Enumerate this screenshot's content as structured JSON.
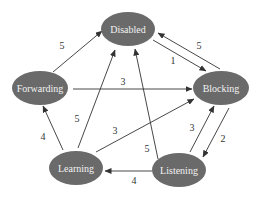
{
  "diagram": {
    "type": "state-transition-graph",
    "nodes": [
      {
        "id": "disabled",
        "label": "Disabled",
        "cx": 128,
        "cy": 29,
        "rx": 27,
        "ry": 17
      },
      {
        "id": "forwarding",
        "label": "Forwarding",
        "cx": 40,
        "cy": 88,
        "rx": 28,
        "ry": 17
      },
      {
        "id": "blocking",
        "label": "Blocking",
        "cx": 221,
        "cy": 88,
        "rx": 28,
        "ry": 17
      },
      {
        "id": "learning",
        "label": "Learning",
        "cx": 76,
        "cy": 168,
        "rx": 27,
        "ry": 17
      },
      {
        "id": "listening",
        "label": "Listening",
        "cx": 179,
        "cy": 170,
        "rx": 27,
        "ry": 17
      }
    ],
    "edges": [
      {
        "from": "forwarding",
        "to": "disabled",
        "label": "5",
        "x1": 53,
        "y1": 72,
        "x2": 102,
        "y2": 31,
        "lx": 62,
        "ly": 45
      },
      {
        "from": "disabled",
        "to": "blocking",
        "label": "1",
        "x1": 153,
        "y1": 40,
        "x2": 206,
        "y2": 71,
        "lx": 173,
        "ly": 60
      },
      {
        "from": "blocking",
        "to": "disabled",
        "label": "5",
        "x1": 220,
        "y1": 69,
        "x2": 158,
        "y2": 33,
        "lx": 199,
        "ly": 45
      },
      {
        "from": "forwarding",
        "to": "blocking",
        "label": "3",
        "x1": 73,
        "y1": 89,
        "x2": 192,
        "y2": 89,
        "lx": 123,
        "ly": 81
      },
      {
        "from": "learning",
        "to": "forwarding",
        "label": "4",
        "x1": 63,
        "y1": 150,
        "x2": 43,
        "y2": 106,
        "lx": 43,
        "ly": 136
      },
      {
        "from": "learning",
        "to": "disabled",
        "label": "5",
        "x1": 78,
        "y1": 148,
        "x2": 115,
        "y2": 50,
        "lx": 77,
        "ly": 118
      },
      {
        "from": "learning",
        "to": "blocking",
        "label": "3",
        "x1": 96,
        "y1": 152,
        "x2": 194,
        "y2": 99,
        "lx": 115,
        "ly": 130
      },
      {
        "from": "listening",
        "to": "disabled",
        "label": "5",
        "x1": 158,
        "y1": 159,
        "x2": 135,
        "y2": 49,
        "lx": 147,
        "ly": 148
      },
      {
        "from": "listening",
        "to": "blocking",
        "label": "3",
        "x1": 190,
        "y1": 152,
        "x2": 214,
        "y2": 106,
        "lx": 192,
        "ly": 127
      },
      {
        "from": "blocking",
        "to": "listening",
        "label": "2",
        "x1": 229,
        "y1": 108,
        "x2": 203,
        "y2": 157,
        "lx": 223,
        "ly": 138
      },
      {
        "from": "listening",
        "to": "learning",
        "label": "4",
        "x1": 152,
        "y1": 171,
        "x2": 105,
        "y2": 171,
        "lx": 134,
        "ly": 180
      }
    ]
  }
}
